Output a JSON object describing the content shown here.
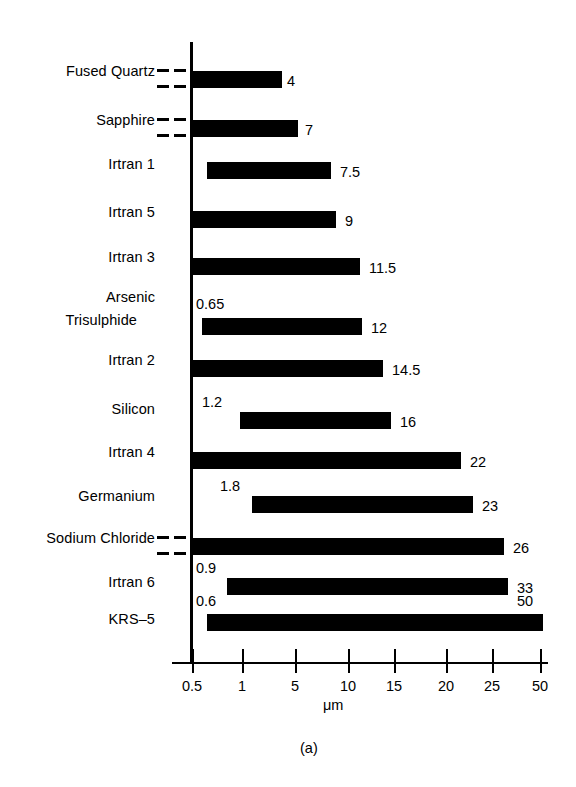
{
  "chart_data": {
    "type": "bar",
    "title": "",
    "subtitle": "",
    "xlabel": "μm",
    "ylabel": "",
    "orientation": "horizontal",
    "grid": false,
    "legend": null,
    "caption": "(a)",
    "axis_scale": "piecewise-nonlinear",
    "xticks": [
      {
        "label": "0.5",
        "value": 0.5,
        "px": 192
      },
      {
        "label": "1",
        "value": 1,
        "px": 242
      },
      {
        "label": "5",
        "value": 5,
        "px": 295
      },
      {
        "label": "10",
        "value": 10,
        "px": 348
      },
      {
        "label": "15",
        "value": 15,
        "px": 394
      },
      {
        "label": "20",
        "value": 20,
        "px": 446
      },
      {
        "label": "25",
        "value": 25,
        "px": 492
      },
      {
        "label": "50",
        "value": 50,
        "px": 540
      }
    ],
    "categories": [
      "Fused Quartz",
      "Sapphire",
      "Irtran 1",
      "Irtran 5",
      "Irtran 3",
      "Arsenic Trisulphide",
      "Irtran 2",
      "Silicon",
      "Irtran 4",
      "Germanium",
      "Sodium Chloride",
      "Irtran 6",
      "KRS–5"
    ],
    "bars": [
      {
        "category": "Fused Quartz",
        "label_lines": [
          "Fused Quartz"
        ],
        "start_value": null,
        "start_label": "",
        "end_value": 4,
        "end_label": "4",
        "break_left": true,
        "px": {
          "x0": 192,
          "x1": 282,
          "y": 71,
          "h": 17
        },
        "label_px": {
          "x": 287,
          "y": 73
        }
      },
      {
        "category": "Sapphire",
        "label_lines": [
          "Sapphire"
        ],
        "start_value": null,
        "start_label": "",
        "end_value": 7,
        "end_label": "7",
        "break_left": true,
        "px": {
          "x0": 192,
          "x1": 298,
          "y": 120,
          "h": 17
        },
        "label_px": {
          "x": 305,
          "y": 122
        }
      },
      {
        "category": "Irtran 1",
        "label_lines": [
          "Irtran 1"
        ],
        "start_value": null,
        "start_label": "",
        "end_value": 7.5,
        "end_label": "7.5",
        "break_left": false,
        "px": {
          "x0": 207,
          "x1": 331,
          "y": 162,
          "h": 17
        },
        "label_px": {
          "x": 340,
          "y": 164
        }
      },
      {
        "category": "Irtran 5",
        "label_lines": [
          "Irtran 5"
        ],
        "start_value": null,
        "start_label": "",
        "end_value": 9,
        "end_label": "9",
        "break_left": false,
        "px": {
          "x0": 192,
          "x1": 336,
          "y": 211,
          "h": 17
        },
        "label_px": {
          "x": 345,
          "y": 213
        }
      },
      {
        "category": "Irtran 3",
        "label_lines": [
          "Irtran 3"
        ],
        "start_value": null,
        "start_label": "",
        "end_value": 11.5,
        "end_label": "11.5",
        "break_left": false,
        "px": {
          "x0": 192,
          "x1": 360,
          "y": 258,
          "h": 17
        },
        "label_px": {
          "x": 369,
          "y": 260
        }
      },
      {
        "category": "Arsenic Trisulphide",
        "label_lines": [
          "Arsenic",
          "  Trisulphide"
        ],
        "start_value": 0.65,
        "start_label": "0.65",
        "end_value": 12,
        "end_label": "12",
        "break_left": false,
        "px": {
          "x0": 202,
          "x1": 362,
          "y": 318,
          "h": 17
        },
        "label_px": {
          "x": 371,
          "y": 320
        },
        "start_label_px": {
          "x": 196,
          "y": 296
        }
      },
      {
        "category": "Irtran 2",
        "label_lines": [
          "Irtran 2"
        ],
        "start_value": null,
        "start_label": "",
        "end_value": 14.5,
        "end_label": "14.5",
        "break_left": false,
        "px": {
          "x0": 192,
          "x1": 383,
          "y": 360,
          "h": 17
        },
        "label_px": {
          "x": 392,
          "y": 362
        }
      },
      {
        "category": "Silicon",
        "label_lines": [
          "Silicon"
        ],
        "start_value": 1.2,
        "start_label": "1.2",
        "end_value": 16,
        "end_label": "16",
        "break_left": false,
        "px": {
          "x0": 240,
          "x1": 391,
          "y": 412,
          "h": 17
        },
        "label_px": {
          "x": 400,
          "y": 414
        },
        "start_label_px": {
          "x": 202,
          "y": 394
        }
      },
      {
        "category": "Irtran 4",
        "label_lines": [
          "Irtran 4"
        ],
        "start_value": null,
        "start_label": "",
        "end_value": 22,
        "end_label": "22",
        "break_left": false,
        "px": {
          "x0": 192,
          "x1": 461,
          "y": 452,
          "h": 17
        },
        "label_px": {
          "x": 470,
          "y": 454
        }
      },
      {
        "category": "Germanium",
        "label_lines": [
          "Germanium"
        ],
        "start_value": 1.8,
        "start_label": "1.8",
        "end_value": 23,
        "end_label": "23",
        "break_left": false,
        "px": {
          "x0": 252,
          "x1": 473,
          "y": 496,
          "h": 17
        },
        "label_px": {
          "x": 482,
          "y": 498
        },
        "start_label_px": {
          "x": 220,
          "y": 478
        }
      },
      {
        "category": "Sodium Chloride",
        "label_lines": [
          "Sodium Chloride"
        ],
        "start_value": null,
        "start_label": "",
        "end_value": 26,
        "end_label": "26",
        "break_left": true,
        "px": {
          "x0": 192,
          "x1": 504,
          "y": 538,
          "h": 17
        },
        "label_px": {
          "x": 513,
          "y": 540
        }
      },
      {
        "category": "Irtran 6",
        "label_lines": [
          "Irtran 6"
        ],
        "start_value": 0.9,
        "start_label": "0.9",
        "end_value": 33,
        "end_label": "33",
        "break_left": false,
        "px": {
          "x0": 227,
          "x1": 508,
          "y": 578,
          "h": 17
        },
        "label_px": {
          "x": 517,
          "y": 580
        },
        "start_label_px": {
          "x": 196,
          "y": 560
        }
      },
      {
        "category": "KRS–5",
        "label_lines": [
          "KRS–5"
        ],
        "start_value": 0.6,
        "start_label": "0.6",
        "end_value": 50,
        "end_label": "50",
        "break_left": false,
        "px": {
          "x0": 207,
          "x1": 543,
          "y": 614,
          "h": 17
        },
        "label_px": {
          "x": 517,
          "y": 593
        },
        "start_label_px": {
          "x": 196,
          "y": 593
        }
      }
    ],
    "category_label_px": [
      {
        "text": "Fused Quartz",
        "y": 71
      },
      {
        "text": "Sapphire",
        "y": 120
      },
      {
        "text": "Irtran 1",
        "y": 164
      },
      {
        "text": "Irtran 5",
        "y": 212
      },
      {
        "text": "Irtran 3",
        "y": 257
      },
      {
        "text": "Arsenic",
        "y": 297
      },
      {
        "text": "Trisulphide",
        "y": 320,
        "indent": 18
      },
      {
        "text": "Irtran 2",
        "y": 360
      },
      {
        "text": "Silicon",
        "y": 409
      },
      {
        "text": "Irtran 4",
        "y": 452
      },
      {
        "text": "Germanium",
        "y": 496
      },
      {
        "text": "Sodium Chloride",
        "y": 538
      },
      {
        "text": "Irtran 6",
        "y": 582
      },
      {
        "text": "KRS–5",
        "y": 619
      }
    ],
    "axis": {
      "vertical_line_px": {
        "x": 190,
        "y0": 42,
        "y1": 662,
        "w": 3
      },
      "horizontal_line_px": {
        "x0": 172,
        "x1": 548,
        "y": 662,
        "h": 2
      },
      "tick_height": 14
    }
  }
}
